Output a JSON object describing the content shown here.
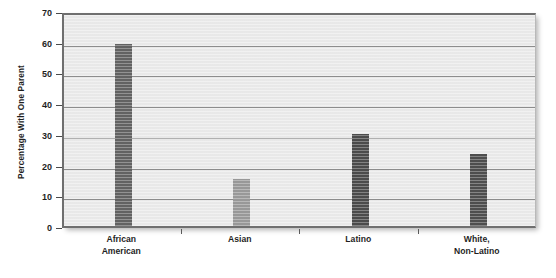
{
  "chart_data": {
    "type": "bar",
    "title": "",
    "subtitle": "",
    "xlabel": "",
    "ylabel": "Percentage With One Parent",
    "categories": [
      "African\nAmerican",
      "Asian",
      "Latino",
      "White,\nNon-Latino"
    ],
    "values": [
      59.3,
      15.3,
      29.8,
      23.4
    ],
    "series": [
      {
        "name": "Percentage With One Parent",
        "values": [
          59.3,
          15.3,
          29.8,
          23.4
        ]
      }
    ],
    "bar_colors": [
      "#636363",
      "#9a9a9a",
      "#4c4c4c",
      "#4f4f4f"
    ],
    "ylim": [
      0,
      70
    ],
    "ytick_labels": [
      "0",
      "10",
      "20",
      "30",
      "40",
      "50",
      "60",
      "70"
    ],
    "ytick_values": [
      0,
      10,
      20,
      30,
      40,
      50,
      60,
      70
    ],
    "grid": true,
    "grid_axis": "y",
    "legend": false,
    "legend_position": "none",
    "plot_background": "#ebebeb",
    "axis_color": "#6f6f6f",
    "gridline_color": "#8e8e8e",
    "text_color": "#1f1f1f"
  }
}
